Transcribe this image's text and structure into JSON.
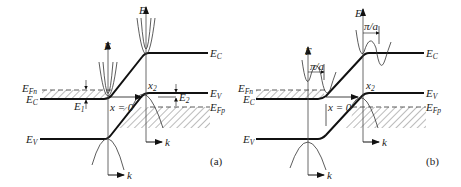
{
  "figure": {
    "panels": [
      {
        "id": "a",
        "label": "(a)",
        "labels": {
          "E_Fn": "E",
          "E_Fn_sub": "Fn",
          "E_C_left": "E",
          "E_C_left_sub": "C",
          "E_V_left": "E",
          "E_V_left_sub": "V",
          "E_C_right": "E",
          "E_C_right_sub": "C",
          "E_V_right": "E",
          "E_V_right_sub": "V",
          "E_Fp": "E",
          "E_Fp_sub": "Fp",
          "E1": "E",
          "E1_sub": "1",
          "E2": "E",
          "E2_sub": "2",
          "x0": "x = 0",
          "x2": "x",
          "x2_sub": "2",
          "axis_E_left": "E",
          "axis_E_right": "E",
          "axis_k_left": "k",
          "axis_k_right": "k"
        }
      },
      {
        "id": "b",
        "label": "(b)",
        "labels": {
          "E_Fn": "E",
          "E_Fn_sub": "Fn",
          "E_C_left": "E",
          "E_C_left_sub": "C",
          "E_V_left": "E",
          "E_V_left_sub": "V",
          "E_C_right": "E",
          "E_C_right_sub": "C",
          "E_V_right": "E",
          "E_V_right_sub": "V",
          "E_Fp": "E",
          "E_Fp_sub": "Fp",
          "pi_a_left": "π/a",
          "pi_a_right": "π/a",
          "x0": "x = 0",
          "x2": "x",
          "x2_sub": "2",
          "axis_E_left": "E",
          "axis_E_right": "E",
          "axis_k_left": "k",
          "axis_k_right": "k"
        }
      }
    ]
  }
}
